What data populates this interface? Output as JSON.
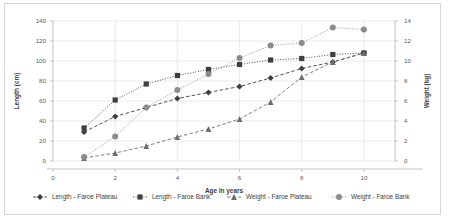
{
  "chart_data": {
    "type": "line",
    "title": "",
    "xlabel": "Age in years",
    "ylabel": "Length (cm)",
    "y2label": "Weight (kg)",
    "x": [
      1,
      2,
      3,
      4,
      5,
      6,
      7,
      8,
      9,
      10
    ],
    "xlim": [
      0,
      11
    ],
    "xticks": [
      0,
      2,
      4,
      6,
      8,
      10
    ],
    "ylim": [
      0,
      140
    ],
    "yticks": [
      0,
      20,
      40,
      60,
      80,
      100,
      120,
      140
    ],
    "y2lim": [
      0,
      14
    ],
    "y2ticks": [
      0,
      2,
      4,
      6,
      8,
      10,
      12,
      14
    ],
    "grid": true,
    "legend_position": "bottom",
    "series": [
      {
        "name": "Length - Faroe Plateau",
        "axis": "left",
        "unit": "cm",
        "marker": "diamond",
        "line": "dashed",
        "color": "#3f3f3f",
        "x": [
          1,
          2,
          3,
          4,
          5,
          6,
          7,
          8,
          9,
          10
        ],
        "values": [
          29,
          44.5,
          53.5,
          62.5,
          68.5,
          74.5,
          83,
          92.5,
          99,
          108
        ]
      },
      {
        "name": "Length - Faroe Bank",
        "axis": "left",
        "unit": "cm",
        "marker": "square",
        "line": "dotted",
        "color": "#3f3f3f",
        "x": [
          1,
          2,
          3,
          4,
          5,
          6,
          7,
          8,
          9,
          10
        ],
        "values": [
          33,
          61,
          77,
          85.5,
          91.5,
          96.5,
          101,
          102.5,
          106.5,
          108
        ]
      },
      {
        "name": "Weight - Faroe Plateau",
        "axis": "right",
        "unit": "kg",
        "marker": "triangle",
        "line": "dashed",
        "color": "#6e6e6e",
        "x": [
          1,
          2,
          3,
          4,
          5,
          6,
          7,
          8,
          9,
          10
        ],
        "values": [
          0.3,
          0.8,
          1.5,
          2.4,
          3.2,
          4.2,
          5.9,
          8.4,
          9.9,
          10.8
        ]
      },
      {
        "name": "Weight - Faroe Bank",
        "axis": "right",
        "unit": "kg",
        "marker": "circle",
        "line": "dotted",
        "color": "#8c8c8c",
        "x": [
          1,
          2,
          3,
          4,
          5,
          6,
          7,
          8,
          9,
          10
        ],
        "values": [
          0.4,
          2.45,
          5.35,
          7.1,
          8.7,
          10.3,
          11.55,
          11.8,
          13.35,
          13.15
        ]
      }
    ]
  },
  "axes": {
    "x_title": "Age in years",
    "y_left_title": "Length (cm)",
    "y_right_title": "Weight (kg)",
    "x_ticks": [
      "0",
      "2",
      "4",
      "6",
      "8",
      "10"
    ],
    "y_left_ticks": [
      "0",
      "20",
      "40",
      "60",
      "80",
      "100",
      "120",
      "140"
    ],
    "y_right_ticks": [
      "0",
      "2",
      "4",
      "6",
      "8",
      "10",
      "12",
      "14"
    ]
  },
  "legend": {
    "items": [
      {
        "label": "Length - Faroe Plateau",
        "marker": "diamond-marker",
        "line": "dashed",
        "color": "#3f3f3f"
      },
      {
        "label": "Length - Faroe Bank",
        "marker": "square-marker",
        "line": "dotted",
        "color": "#3f3f3f"
      },
      {
        "label": "Weight - Faroe Plateau",
        "marker": "triangle-marker",
        "line": "dashed",
        "color": "#6e6e6e"
      },
      {
        "label": "Weight - Faroe Bank",
        "marker": "circle-marker",
        "line": "dotted",
        "color": "#8c8c8c"
      }
    ]
  },
  "colors": {
    "grid": "#e2e2e2",
    "axis": "#b4b4b4",
    "border": "#d6d6d6",
    "text": "#3d3d3d",
    "background": "#ffffff"
  }
}
